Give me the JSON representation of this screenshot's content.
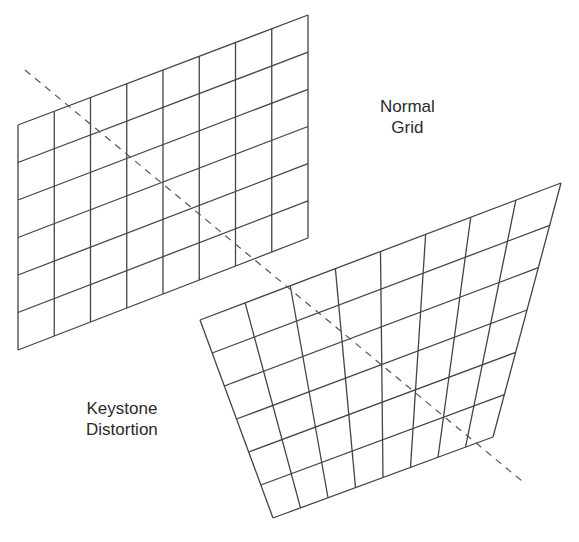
{
  "labels": {
    "normal_line1": "Normal",
    "normal_line2": "Grid",
    "keystone_line1": "Keystone",
    "keystone_line2": "Distortion"
  },
  "normal_grid": {
    "corners": {
      "tl": [
        18,
        125
      ],
      "tr": [
        308,
        15
      ],
      "br": [
        308,
        238
      ],
      "bl": [
        18,
        350
      ]
    },
    "columns": 8,
    "rows": 6
  },
  "keystone_grid": {
    "corners": {
      "tl": [
        200,
        320
      ],
      "tr": [
        561,
        183
      ],
      "br": [
        493,
        437
      ],
      "bl": [
        273,
        518
      ]
    },
    "columns": 8,
    "rows": 6
  },
  "axis_line": {
    "start": [
      25,
      70
    ],
    "end": [
      522,
      481
    ]
  },
  "colors": {
    "line": "#444444",
    "text": "#2a2a2a",
    "background": "#ffffff"
  }
}
